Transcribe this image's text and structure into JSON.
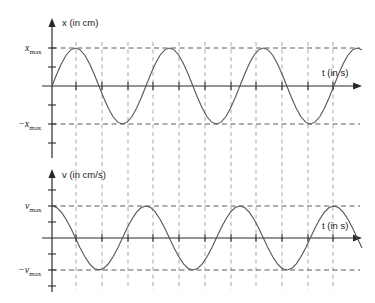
{
  "chart_data": [
    {
      "id": "displacement",
      "type": "line",
      "title": "",
      "ylabel": "x (in cm)",
      "xlabel": "t (in s)",
      "ytick_labels": [
        "x",
        "max",
        "−x",
        "max"
      ],
      "ytick_positive": "x",
      "ytick_positive_sub": "max",
      "ytick_negative": "−x",
      "ytick_negative_sub": "max",
      "function": "x = x_max * sin(2*pi*t/T)",
      "amplitude_label": "x_max",
      "phase_deg": 0,
      "periods_shown": 3.3,
      "grid": "vertical dashed guides at quarter-period intervals; horizontal dashed lines at +x_max and -x_max",
      "ylim": [
        "-x_max",
        "x_max"
      ],
      "x": [
        0.0,
        0.05,
        0.1,
        0.15,
        0.2,
        0.25,
        0.3,
        0.35,
        0.4,
        0.45,
        0.5,
        0.55,
        0.6,
        0.65,
        0.7,
        0.75,
        0.8,
        0.85,
        0.9,
        0.95,
        1.0,
        1.05,
        1.1,
        1.15,
        1.2,
        1.25,
        1.3,
        1.35,
        1.4,
        1.45,
        1.5,
        1.55,
        1.6,
        1.65,
        1.7,
        1.75,
        1.8,
        1.85,
        1.9,
        1.95,
        2.0,
        2.05,
        2.1,
        2.15,
        2.2,
        2.25,
        2.3,
        2.35,
        2.4,
        2.45,
        2.5,
        2.55,
        2.6,
        2.65,
        2.7,
        2.75,
        2.8,
        2.85,
        2.9,
        2.95,
        3.0,
        3.05,
        3.1,
        3.15,
        3.2,
        3.25,
        3.3
      ],
      "values": [
        0.0,
        0.309,
        0.588,
        0.809,
        0.951,
        1.0,
        0.951,
        0.809,
        0.588,
        0.309,
        0.0,
        -0.309,
        -0.588,
        -0.809,
        -0.951,
        -1.0,
        -0.951,
        -0.809,
        -0.588,
        -0.309,
        0.0,
        0.309,
        0.588,
        0.809,
        0.951,
        1.0,
        0.951,
        0.809,
        0.588,
        0.309,
        0.0,
        -0.309,
        -0.588,
        -0.809,
        -0.951,
        -1.0,
        -0.951,
        -0.809,
        -0.588,
        -0.309,
        0.0,
        0.309,
        0.588,
        0.809,
        0.951,
        1.0,
        0.951,
        0.809,
        0.588,
        0.309,
        0.0,
        -0.309,
        -0.588,
        -0.809,
        -0.951,
        -1.0,
        -0.951,
        -0.809,
        -0.588,
        -0.309,
        0.0,
        0.309,
        0.588,
        0.809,
        0.951,
        1.0,
        0.951
      ]
    },
    {
      "id": "velocity",
      "type": "line",
      "title": "",
      "ylabel": "v (in cm/s)",
      "xlabel": "t (in s)",
      "ytick_positive": "v",
      "ytick_positive_sub": "max",
      "ytick_negative": "−v",
      "ytick_negative_sub": "max",
      "function": "v = v_max * cos(2*pi*t/T)",
      "amplitude_label": "v_max",
      "phase_deg": 90,
      "periods_shown": 3.3,
      "grid": "vertical dashed guides at quarter-period intervals; horizontal dashed lines at +v_max and -v_max",
      "ylim": [
        "-v_max",
        "v_max"
      ],
      "x": [
        0.0,
        0.05,
        0.1,
        0.15,
        0.2,
        0.25,
        0.3,
        0.35,
        0.4,
        0.45,
        0.5,
        0.55,
        0.6,
        0.65,
        0.7,
        0.75,
        0.8,
        0.85,
        0.9,
        0.95,
        1.0,
        1.05,
        1.1,
        1.15,
        1.2,
        1.25,
        1.3,
        1.35,
        1.4,
        1.45,
        1.5,
        1.55,
        1.6,
        1.65,
        1.7,
        1.75,
        1.8,
        1.85,
        1.9,
        1.95,
        2.0,
        2.05,
        2.1,
        2.15,
        2.2,
        2.25,
        2.3,
        2.35,
        2.4,
        2.45,
        2.5,
        2.55,
        2.6,
        2.65,
        2.7,
        2.75,
        2.8,
        2.85,
        2.9,
        2.95,
        3.0,
        3.05,
        3.1,
        3.15,
        3.2,
        3.25,
        3.3
      ],
      "values": [
        1.0,
        0.951,
        0.809,
        0.588,
        0.309,
        0.0,
        -0.309,
        -0.588,
        -0.809,
        -0.951,
        -1.0,
        -0.951,
        -0.809,
        -0.588,
        -0.309,
        0.0,
        0.309,
        0.588,
        0.809,
        0.951,
        1.0,
        0.951,
        0.809,
        0.588,
        0.309,
        0.0,
        -0.309,
        -0.588,
        -0.809,
        -0.951,
        -1.0,
        -0.951,
        -0.809,
        -0.588,
        -0.309,
        0.0,
        0.309,
        0.588,
        0.809,
        0.951,
        1.0,
        0.951,
        0.809,
        0.588,
        0.309,
        0.0,
        -0.309,
        -0.588,
        -0.809,
        -0.951,
        -1.0,
        -0.951,
        -0.809,
        -0.588,
        -0.309,
        0.0,
        0.309,
        0.588,
        0.809,
        0.951,
        1.0,
        0.951,
        0.809,
        0.588,
        0.309,
        0.0,
        -0.309
      ]
    }
  ],
  "labels": {
    "x_axis_top": "x (in cm)",
    "t_axis_top": "t (in s)",
    "v_axis_bottom": "v (in cm/s)",
    "t_axis_bottom": "t (in s)",
    "x_max_main": "x",
    "x_max_sub": "max",
    "neg_x_max_main": "−x",
    "neg_x_max_sub": "max",
    "v_max_main": "v",
    "v_max_sub": "max",
    "neg_v_max_main": "−v",
    "neg_v_max_sub": "max"
  },
  "colors": {
    "background": "#ffffff",
    "curve": "#555555",
    "axis": "#2a2a2a",
    "dash_horizontal": "#4a4a4a",
    "dash_vertical": "#9a9a9a",
    "text": "#1a1a1a"
  }
}
